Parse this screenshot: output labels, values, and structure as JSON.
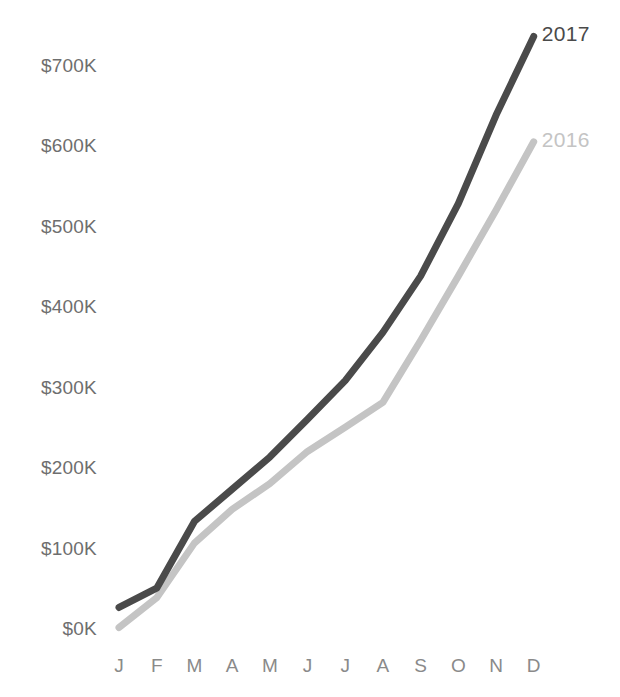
{
  "chart_data": {
    "type": "line",
    "title": "",
    "xlabel": "",
    "ylabel": "",
    "categories": [
      "J",
      "F",
      "M",
      "A",
      "M",
      "J",
      "J",
      "A",
      "S",
      "O",
      "N",
      "D"
    ],
    "category_names": [
      "January",
      "February",
      "March",
      "April",
      "May",
      "June",
      "July",
      "August",
      "September",
      "October",
      "November",
      "December"
    ],
    "ylim": [
      0,
      700000
    ],
    "ytick_values": [
      0,
      100000,
      200000,
      300000,
      400000,
      500000,
      600000,
      700000
    ],
    "ytick_labels": [
      "$0K",
      "$100K",
      "$200K",
      "$300K",
      "$400K",
      "$500K",
      "$600K",
      "$700K"
    ],
    "grid": false,
    "legend_position": "line-end-right",
    "series": [
      {
        "name": "2017",
        "color": "#4a4a4a",
        "label": "2017",
        "values": [
          28000,
          52000,
          135000,
          175000,
          215000,
          262000,
          310000,
          370000,
          440000,
          530000,
          640000,
          738000
        ]
      },
      {
        "name": "2016",
        "color": "#c4c4c4",
        "label": "2016",
        "values": [
          3000,
          40000,
          108000,
          150000,
          182000,
          222000,
          252000,
          283000,
          360000,
          440000,
          522000,
          607000
        ]
      }
    ]
  },
  "axis": {
    "y_labels": [
      "$700K",
      "$600K",
      "$500K",
      "$400K",
      "$300K",
      "$200K",
      "$100K",
      "$0K"
    ],
    "x_labels": [
      "J",
      "F",
      "M",
      "A",
      "M",
      "J",
      "J",
      "A",
      "S",
      "O",
      "N",
      "D"
    ]
  },
  "legend": {
    "items": [
      {
        "label": "2017",
        "color": "#4a4a4a"
      },
      {
        "label": "2016",
        "color": "#c4c4c4"
      }
    ]
  }
}
